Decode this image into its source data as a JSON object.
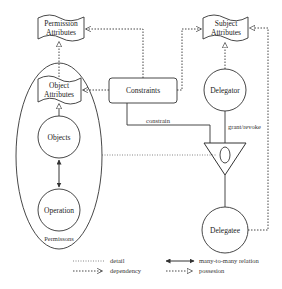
{
  "diagram": {
    "nodes": {
      "permission_attributes": {
        "line1": "Permission",
        "line2": "Attributes"
      },
      "subject_attributes": {
        "line1": "Subject",
        "line2": "Attributes"
      },
      "object_attributes": {
        "line1": "Object",
        "line2": "Attributes"
      },
      "constraints": "Constraints",
      "objects": "Objects",
      "operation": "Operation",
      "permissions": "Permissons",
      "delegator": "Delegator",
      "delegatee": "Delegatee"
    },
    "edge_labels": {
      "constrain": "constrain",
      "grant_revoke": "grant/revoke"
    }
  },
  "legend": {
    "detail": "detail",
    "dependency": "dependency",
    "many_to_many": "many-to-many relation",
    "possession": "possesion"
  },
  "colors": {
    "line": "#333333",
    "background": "#ffffff"
  }
}
